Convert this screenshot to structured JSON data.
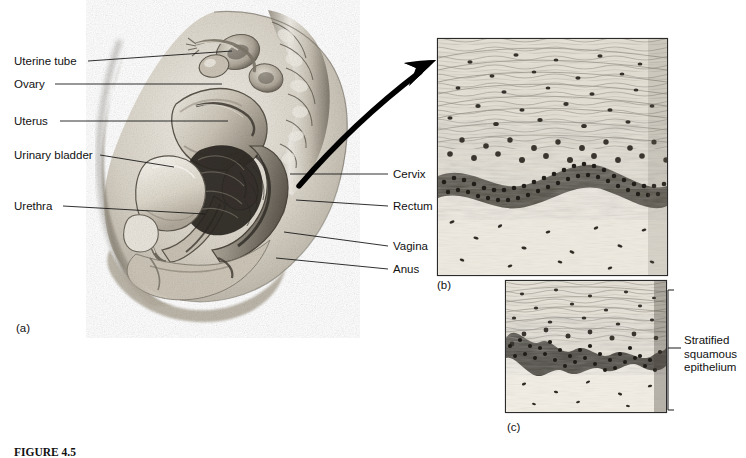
{
  "figure": {
    "caption": "FIGURE 4.5",
    "artist_signature": "Waldrop"
  },
  "panels": [
    {
      "id": "a",
      "label": "(a)",
      "type": "anatomical-illustration",
      "description": "Midsagittal section of the female pelvis"
    },
    {
      "id": "b",
      "label": "(b)",
      "type": "light-micrograph",
      "description": "Stratified squamous epithelium of the vagina"
    },
    {
      "id": "c",
      "label": "(c)",
      "type": "light-micrograph",
      "description": "Stratified squamous epithelium"
    }
  ],
  "labels_left": [
    {
      "text": "Uterine tube",
      "x": 14,
      "y": 55,
      "line_x1": 88,
      "line_y1": 61,
      "line_x2": 232,
      "line_y2": 51
    },
    {
      "text": "Ovary",
      "x": 14,
      "y": 78,
      "line_x1": 55,
      "line_y1": 84,
      "line_x2": 222,
      "line_y2": 84
    },
    {
      "text": "Uterus",
      "x": 14,
      "y": 115,
      "line_x1": 60,
      "line_y1": 121,
      "line_x2": 228,
      "line_y2": 121
    },
    {
      "text": "Urinary bladder",
      "x": 14,
      "y": 149,
      "line_x1": 100,
      "line_y1": 155,
      "line_x2": 174,
      "line_y2": 167
    },
    {
      "text": "Urethra",
      "x": 14,
      "y": 200,
      "line_x1": 63,
      "line_y1": 206,
      "line_x2": 205,
      "line_y2": 214
    }
  ],
  "labels_right": [
    {
      "text": "Cervix",
      "x": 393,
      "y": 168,
      "line_x1": 388,
      "line_y1": 174,
      "line_x2": 290,
      "line_y2": 174
    },
    {
      "text": "Rectum",
      "x": 393,
      "y": 200,
      "line_x1": 388,
      "line_y1": 206,
      "line_x2": 296,
      "line_y2": 200
    },
    {
      "text": "Vagina",
      "x": 393,
      "y": 240,
      "line_x1": 388,
      "line_y1": 246,
      "line_x2": 284,
      "line_y2": 232
    },
    {
      "text": "Anus",
      "x": 393,
      "y": 263,
      "line_x1": 388,
      "line_y1": 269,
      "line_x2": 276,
      "line_y2": 258
    }
  ],
  "bracket_label": {
    "lines": [
      "Stratified",
      "squamous",
      "epithelium"
    ],
    "top": 290,
    "bottom": 410,
    "x": 668
  },
  "colors": {
    "ink": "#111111",
    "leader": "#1a1a1a",
    "arrow": "#000000",
    "panel_border": "#2b2b2b",
    "tissue_light": "#e8e3d8",
    "tissue_mid": "#b9b2a3",
    "tissue_dark": "#6f6a5e",
    "background": "#ffffff"
  }
}
